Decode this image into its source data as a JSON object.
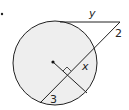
{
  "diagram": {
    "type": "circle-tangent-secant",
    "labels": {
      "tangent": "y",
      "secant_external": "2",
      "chord_segment": "x",
      "chord_lower": "3"
    },
    "elements": [
      "circle",
      "center-point",
      "tangent-segment",
      "secant-line",
      "perpendicular-radius",
      "right-angle-marker",
      "bullet-marker"
    ],
    "colors": {
      "circle_fill": "#eeeeee",
      "stroke": "#222222",
      "background": "#ffffff"
    }
  }
}
